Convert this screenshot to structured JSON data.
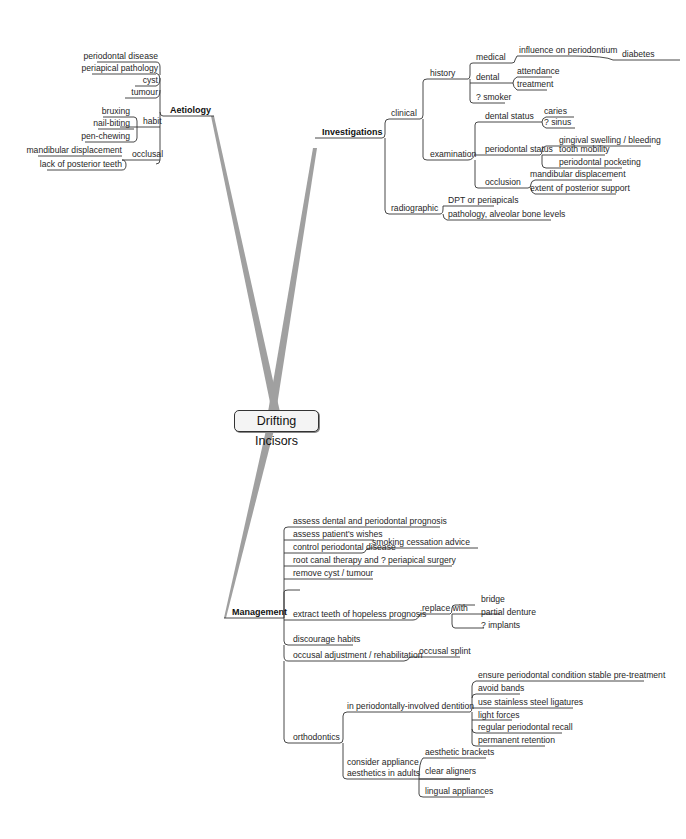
{
  "center": {
    "label": "Drifting Incisors"
  },
  "aetiology": {
    "label": "Aetiology",
    "items": [
      "periodontal disease",
      "periapical pathology",
      "cyst",
      "tumour"
    ],
    "habit": {
      "label": "habit",
      "items": [
        "bruxing",
        "nail-biting",
        "pen-chewing"
      ]
    },
    "occlusal": {
      "label": "occlusal",
      "items": [
        "mandibular displacement",
        "lack of posterior teeth"
      ]
    }
  },
  "investigations": {
    "label": "Investigations",
    "clinical": {
      "label": "clinical",
      "history": {
        "label": "history",
        "medical": {
          "label": "medical",
          "child": "influence on periodontium",
          "grandchild": "diabetes"
        },
        "dental": {
          "label": "dental",
          "items": [
            "attendance",
            "treatment"
          ]
        },
        "smoker": "? smoker"
      },
      "examination": {
        "label": "examination",
        "dental_status": {
          "label": "dental status",
          "items": [
            "caries",
            "? sinus"
          ]
        },
        "periodontal_status": {
          "label": "periodontal status",
          "items": [
            "gingival swelling / bleeding",
            "tooth mobility",
            "periodontal pocketing"
          ]
        },
        "occlusion": {
          "label": "occlusion",
          "items": [
            "mandibular displacement",
            "extent of posterior support"
          ]
        }
      }
    },
    "radiographic": {
      "label": "radiographic",
      "items": [
        "DPT or periapicals",
        "pathology, alveolar bone levels"
      ]
    }
  },
  "management": {
    "label": "Management",
    "items": [
      "assess dental and periodontal prognosis",
      "assess patient's wishes",
      "control periodontal disease",
      "root canal therapy and ? periapical surgery",
      "remove cyst / tumour",
      "extract teeth of hopeless prognosis",
      "discourage habits",
      "occusal adjustment / rehabilitation",
      "orthodontics"
    ],
    "smoking": "smoking cessation advice",
    "replace": {
      "label": "replace with",
      "items": [
        "bridge",
        "partial denture",
        "? implants"
      ]
    },
    "occlusal_splint": "occusal splint",
    "ortho": {
      "perio": {
        "label": "in periodontally-involved dentition",
        "items": [
          "ensure periodontal condition stable pre-treatment",
          "avoid bands",
          "use stainless steel ligatures",
          "light forces",
          "regular periodontal recall",
          "permanent retention"
        ]
      },
      "adults": {
        "label1": "consider appliance",
        "label2": "aesthetics in adults",
        "items": [
          "aesthetic brackets",
          "clear aligners",
          "lingual appliances"
        ]
      }
    }
  },
  "colors": {
    "line": "#333333",
    "spoke": "#9a9a9a",
    "center_bg": "#f4f4f4"
  }
}
